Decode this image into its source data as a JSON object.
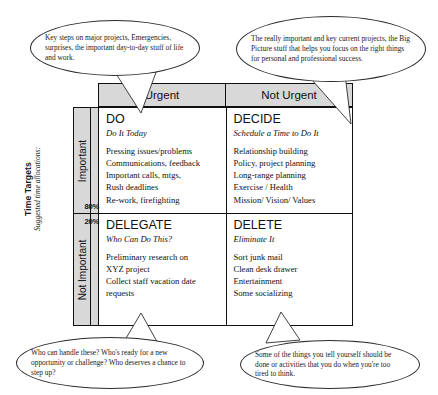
{
  "diagram": {
    "axis": {
      "caption_main": "Time Targets",
      "caption_sub": "Suggested time allocations:"
    },
    "columns": [
      {
        "label": "Urgent"
      },
      {
        "label": "Not Urgent"
      }
    ],
    "rows": [
      {
        "label": "Important",
        "percent": "80%"
      },
      {
        "label": "Not Important",
        "percent": "20%"
      }
    ],
    "quadrants": {
      "do": {
        "title": "DO",
        "subtitle": "Do It Today",
        "items": "Pressing issues/problems\nCommunications, feedback\nImportant calls, mtgs,\nRush deadlines\nRe-work, firefighting"
      },
      "decide": {
        "title": "DECIDE",
        "subtitle": "Schedule a Time to Do It",
        "items": "Relationship building\nPolicy, project planning\nLong-range planning\nExercise / Health\nMission/ Vision/ Values"
      },
      "delegate": {
        "title": "DELEGATE",
        "subtitle": "Who Can Do This?",
        "items": "Preliminary research on\nXYZ project\nCollect staff vacation date\nrequests"
      },
      "delete": {
        "title": "DELETE",
        "subtitle": "Eliminate It",
        "items": "Sort junk mail\nClean desk drawer\nEntertainment\nSome socializing"
      }
    },
    "callouts": {
      "do": "Key steps on major projects, Emergencies, surprises, the important day-to-day stuff of life and work.",
      "decide": "The really important and key current projects, the Big Picture stuff that helps you focus on the right things for personal and professional success.",
      "delegate": "Who can handle these? Who's ready for a new opportunity or challenge? Who deserves a chance to step up?",
      "delete": "Some of the things you tell yourself should be done or activities that you do when you're too tired to think."
    },
    "colors": {
      "header_fill": "#d8d8d8",
      "border": "#111111",
      "text": "#1a1a1a",
      "background": "#ffffff"
    }
  }
}
